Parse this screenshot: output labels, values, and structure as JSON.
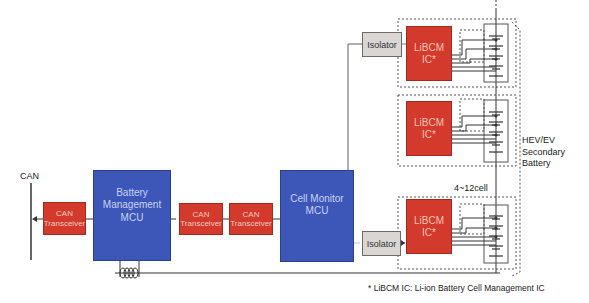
{
  "diagram": {
    "can_bus_label": "CAN",
    "bm_mcu": {
      "line1": "Battery",
      "line2": "Management",
      "line3": "MCU"
    },
    "cm_mcu": {
      "line1": "Cell Monitor",
      "line2": "MCU"
    },
    "can_transceivers": [
      {
        "line1": "CAN",
        "line2": "Transceiver"
      },
      {
        "line1": "CAN",
        "line2": "Transceiver"
      },
      {
        "line1": "CAN",
        "line2": "Transceiver"
      }
    ],
    "isolators": [
      {
        "label": "Isolator"
      },
      {
        "label": "Isolator"
      }
    ],
    "libcm_ics": [
      {
        "line1": "LiBCM",
        "line2": "IC*"
      },
      {
        "line1": "LiBCM",
        "line2": "IC*"
      },
      {
        "line1": "LiBCM",
        "line2": "IC*"
      }
    ],
    "cell_count_label": "4~12cell",
    "battery_label": {
      "line1": "HEV/EV",
      "line2": "Secondary",
      "line3": "Battery"
    },
    "footnote": "* LiBCM IC: Li-ion Battery Cell Management IC",
    "colors": {
      "red": "#d43a2c",
      "blue": "#3c57b8",
      "grey": "#d9d6d3"
    }
  }
}
